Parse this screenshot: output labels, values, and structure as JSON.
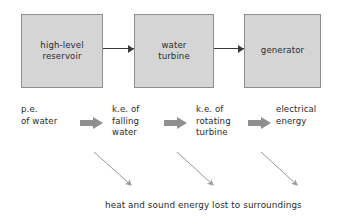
{
  "diagram": {
    "colors": {
      "box_fill": "#d5d5d5",
      "box_border": "#8e8e8e",
      "text": "#2b2b2b",
      "block_arrow": "#8f8f8f",
      "loss_arrow": "#9a9a9a",
      "connector_arrow": "#3a3a3a",
      "background": "#ffffff"
    },
    "stages": [
      {
        "id": "reservoir",
        "label": "high-level\nreservoir"
      },
      {
        "id": "turbine",
        "label": "water\nturbine"
      },
      {
        "id": "generator",
        "label": "generator"
      }
    ],
    "connectors": [
      {
        "id": "reservoir-to-turbine",
        "from": "reservoir",
        "to": "turbine"
      },
      {
        "id": "turbine-to-generator",
        "from": "turbine",
        "to": "generator"
      }
    ],
    "energy_labels": [
      {
        "id": "pe-water",
        "label": "p.e.\nof water"
      },
      {
        "id": "ke-falling-water",
        "label": "k.e. of\nfalling\nwater"
      },
      {
        "id": "ke-rotating-turbine",
        "label": "k.e. of\nrotating\nturbine"
      },
      {
        "id": "electrical-energy",
        "label": "electrical\nenergy"
      }
    ],
    "block_arrows": [
      {
        "id": "transfer-1",
        "from": "pe-water",
        "to": "ke-falling-water"
      },
      {
        "id": "transfer-2",
        "from": "ke-falling-water",
        "to": "ke-rotating-turbine"
      },
      {
        "id": "transfer-3",
        "from": "ke-rotating-turbine",
        "to": "electrical-energy"
      }
    ],
    "loss_arrows": [
      {
        "id": "loss-1",
        "from": "pe-water"
      },
      {
        "id": "loss-2",
        "from": "ke-falling-water"
      },
      {
        "id": "loss-3",
        "from": "ke-rotating-turbine"
      }
    ],
    "loss_caption": "heat and sound energy lost to surroundings"
  }
}
